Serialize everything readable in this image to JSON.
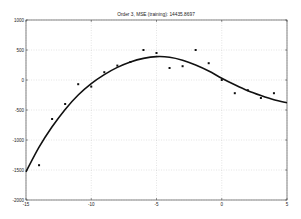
{
  "chart_data": {
    "type": "scatter",
    "title": "Order 3, MSE (training): 14435.8697",
    "xlabel": "",
    "ylabel": "",
    "xlim": [
      -15,
      5
    ],
    "ylim": [
      -2000,
      1000
    ],
    "xticks": [
      -15,
      -10,
      -5,
      0,
      5
    ],
    "yticks": [
      1000,
      500,
      0,
      -500,
      -1000,
      -1500,
      -2000
    ],
    "xtick_labels": [
      "-15",
      "-10",
      "-5",
      "0",
      "5"
    ],
    "ytick_labels": [
      "1000",
      "500",
      "0",
      "-500",
      "-1000",
      "-1500",
      "-2000"
    ],
    "grid": true,
    "legend": null,
    "series": [
      {
        "name": "training data",
        "kind": "scatter",
        "x": [
          -14,
          -13,
          -12,
          -11,
          -10,
          -9,
          -8,
          -7,
          -6,
          -5,
          -4,
          -3,
          -2,
          -1,
          0,
          1,
          2,
          3,
          4
        ],
        "y": [
          -1420,
          -650,
          -400,
          -70,
          -110,
          130,
          240,
          300,
          500,
          450,
          200,
          230,
          500,
          280,
          0,
          -220,
          -170,
          -300,
          -220
        ]
      },
      {
        "name": "order 3 fit",
        "kind": "line",
        "x": [
          -15,
          -14,
          -13,
          -12,
          -11,
          -10,
          -9,
          -8,
          -7,
          -6,
          -5,
          -4,
          -3,
          -2,
          -1,
          0,
          1,
          2,
          3,
          4,
          5
        ],
        "y": [
          -1530,
          -1120,
          -780,
          -490,
          -250,
          -60,
          90,
          210,
          300,
          360,
          390,
          380,
          330,
          250,
          150,
          30,
          -80,
          -180,
          -260,
          -330,
          -380
        ]
      }
    ]
  }
}
